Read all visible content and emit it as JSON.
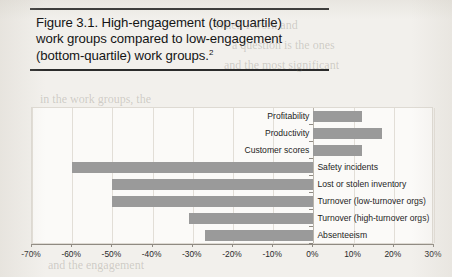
{
  "figure": {
    "caption_line1": "Figure 3.1. High-engagement (top-quartile)",
    "caption_line2": "work groups compared to low-engagement",
    "caption_line3": "(bottom-quartile) work groups.",
    "caption_footnote_marker": "2"
  },
  "chart_data": {
    "type": "bar",
    "orientation": "horizontal",
    "title": "",
    "xlabel": "",
    "ylabel": "",
    "xlim": [
      -70,
      30
    ],
    "xtick_labels": [
      "-70%",
      "-60%",
      "-50%",
      "-40%",
      "-30%",
      "-20%",
      "-10%",
      "0%",
      "10%",
      "20%",
      "30%"
    ],
    "xtick_values": [
      -70,
      -60,
      -50,
      -40,
      -30,
      -20,
      -10,
      0,
      10,
      20,
      30
    ],
    "grid": true,
    "legend": false,
    "bar_color": "#9a9a9a",
    "categories": [
      "Profitability",
      "Productivity",
      "Customer scores",
      "Safety incidents",
      "Lost or stolen inventory",
      "Turnover (low-turnover orgs)",
      "Turnover (high-turnover orgs)",
      "Absenteeism"
    ],
    "values": [
      12,
      17,
      12,
      -60,
      -50,
      -50,
      -31,
      -27
    ]
  },
  "ghost_text": {
    "lines": [
      "When I work and",
      "a question is the ones",
      "and the most significant",
      "in the work groups, the",
      "and the engagement"
    ]
  }
}
